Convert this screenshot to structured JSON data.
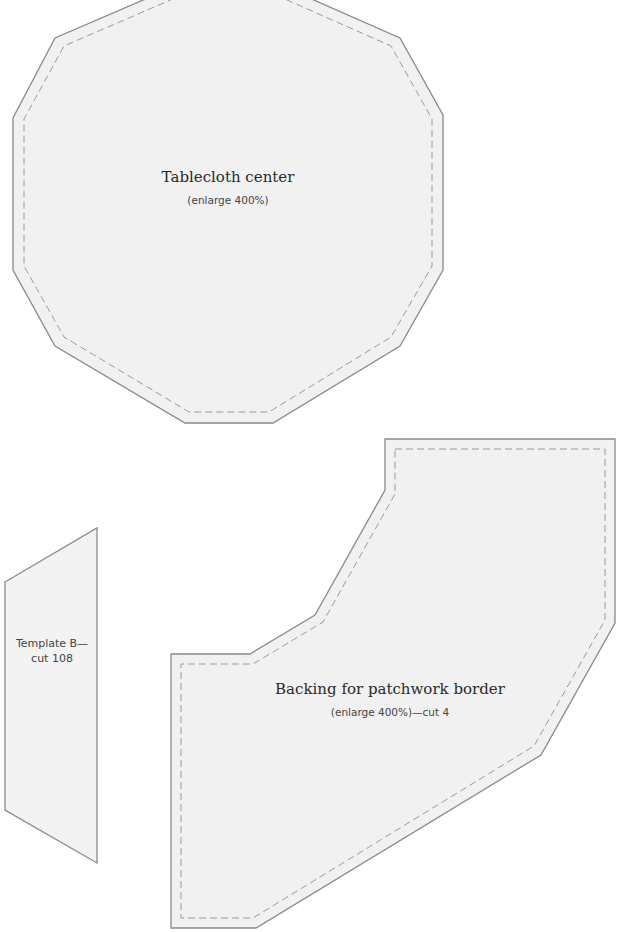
{
  "pieces": [
    {
      "id": "tablecloth-center",
      "title": "Tablecloth center",
      "subtitle": "(enlarge 400%)",
      "points": "185,-18 273,-18 400,38 443,115 443,270 400,346 273,423 185,423 55,346 13,270 13,118 55,38",
      "seam_points": "189,-8 269,-8 391,46 432,119 432,266 391,337 269,412 189,412 64,337 24,266 24,119 64,46"
    },
    {
      "id": "template-b",
      "title": "Template B—",
      "subtitle": "cut 108",
      "points": "5,582 97,528 97,863 5,810"
    },
    {
      "id": "patchwork-border-backing",
      "title": "Backing for patchwork border",
      "subtitle": "(enlarge 400%)—cut 4",
      "points": "385,439 615,439 615,623 541,755 256,928 171,928 171,654 250,654 315,615 385,490",
      "seam_points": "395,449 605,449 605,620 534,746 253,918 181,918 181,664 253,664 323,622 395,494"
    }
  ],
  "colors": {
    "fill": "#f1f1f1",
    "outline": "#8a8a8a",
    "seam": "#9a9a9a"
  }
}
